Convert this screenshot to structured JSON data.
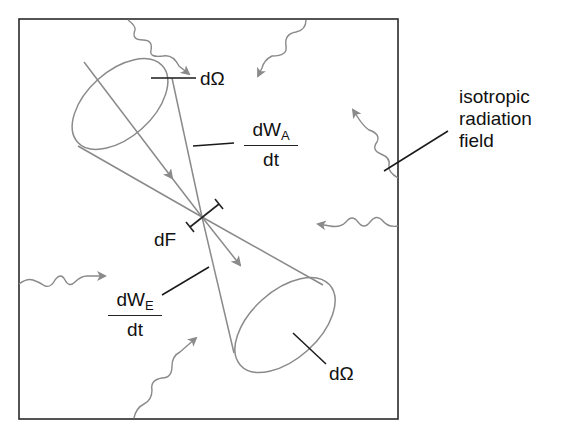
{
  "diagram": {
    "labels": {
      "solid_angle_top": "dΩ",
      "solid_angle_bottom": "dΩ",
      "absorbed_numerator": "dW",
      "absorbed_subscript": "A",
      "absorbed_denominator": "dt",
      "emitted_numerator": "dW",
      "emitted_subscript": "E",
      "emitted_denominator": "dt",
      "area_element": "dF",
      "field_line1": "isotropic",
      "field_line2": "radiation",
      "field_line3": "field"
    },
    "colors": {
      "frame": "#2a2a2a",
      "cone": "#8a8a8a",
      "wave": "#8a8a8a",
      "leader": "#1a1a1a",
      "text": "#111111"
    }
  }
}
